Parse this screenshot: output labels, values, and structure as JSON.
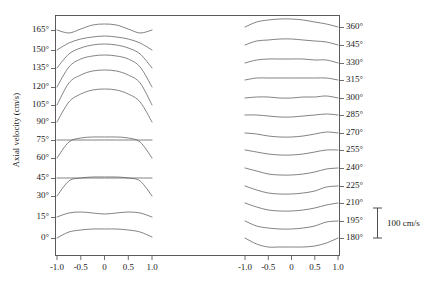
{
  "figure": {
    "y_axis_title": "Axial velocity (cm/s)",
    "scale_bar_label": "100 cm/s"
  },
  "chart_data": {
    "type": "line",
    "title": "",
    "subtitle": "",
    "xlabel": "",
    "ylabel": "Axial velocity (cm/s)",
    "grid": false,
    "legend": "none",
    "scale_bar": {
      "length_value": 100,
      "units": "cm/s",
      "label": "100 cm/s"
    },
    "panels": [
      {
        "name": "left-panel",
        "x": [
          -1.0,
          -0.75,
          -0.5,
          -0.25,
          0.0,
          0.25,
          0.5,
          0.75,
          1.0
        ],
        "xlim": [
          -1.15,
          1.15
        ],
        "xticks": [
          -1.0,
          -0.5,
          0,
          0.5,
          1.0
        ],
        "xticklabels": [
          "-1.0",
          "-0.5",
          "0",
          "0.5",
          "1.0"
        ],
        "offset_labels": [
          "0°",
          "15°",
          "30°",
          "45°",
          "60°",
          "75°",
          "90°",
          "105°",
          "120°",
          "135°",
          "150°",
          "165°"
        ],
        "series": [
          {
            "name": "0°",
            "baseline": 238,
            "values": [
              0,
              6,
              8,
              9,
              9,
              9,
              8,
              6,
              1
            ]
          },
          {
            "name": "15°",
            "baseline": 217,
            "values": [
              0,
              4,
              5,
              4,
              3,
              4,
              5,
              4,
              0
            ]
          },
          {
            "name": "30°",
            "baseline": 196,
            "values": [
              0,
              15,
              18,
              19,
              19,
              19,
              18,
              15,
              0
            ]
          },
          {
            "name": "45°",
            "baseline": 178,
            "values": [
              0,
              0,
              0,
              0,
              0,
              0,
              0,
              0,
              0
            ]
          },
          {
            "name": "60°",
            "baseline": 158,
            "values": [
              0,
              16,
              20,
              21,
              21,
              21,
              20,
              16,
              0
            ]
          },
          {
            "name": "75°",
            "baseline": 140,
            "values": [
              0,
              0,
              0,
              0,
              0,
              0,
              0,
              0,
              0
            ]
          },
          {
            "name": "90°",
            "baseline": 122,
            "values": [
              0,
              20,
              28,
              32,
              33,
              32,
              28,
              20,
              0
            ]
          },
          {
            "name": "105°",
            "baseline": 105,
            "values": [
              0,
              22,
              30,
              34,
              35,
              34,
              30,
              22,
              0
            ]
          },
          {
            "name": "120°",
            "baseline": 87,
            "values": [
              0,
              20,
              28,
              31,
              32,
              31,
              28,
              20,
              0
            ]
          },
          {
            "name": "135°",
            "baseline": 68,
            "values": [
              0,
              14,
              20,
              23,
              24,
              23,
              20,
              14,
              0
            ]
          },
          {
            "name": "150°",
            "baseline": 50,
            "values": [
              0,
              7,
              11,
              13,
              14,
              13,
              11,
              7,
              0
            ]
          },
          {
            "name": "165°",
            "baseline": 30,
            "values": [
              0,
              -3,
              1,
              5,
              6,
              5,
              1,
              -3,
              0
            ]
          }
        ]
      },
      {
        "name": "right-panel",
        "x": [
          -1.0,
          -0.75,
          -0.5,
          -0.25,
          0.0,
          0.25,
          0.5,
          0.75,
          1.0
        ],
        "xlim": [
          -1.15,
          1.15
        ],
        "xticks": [
          -1.0,
          -0.5,
          0,
          0.5,
          1.0
        ],
        "xticklabels": [
          "-1.0",
          "-0.5",
          "0",
          "0.5",
          "1.0"
        ],
        "offset_labels": [
          "180°",
          "195°",
          "210°",
          "225°",
          "240°",
          "255°",
          "270°",
          "285°",
          "300°",
          "315°",
          "330°",
          "345°",
          "360°"
        ],
        "series": [
          {
            "name": "180°",
            "baseline": 238,
            "values": [
              0,
              -6,
              -9,
              -9,
              -9,
              -9,
              -8,
              -5,
              0
            ]
          },
          {
            "name": "195°",
            "baseline": 221,
            "values": [
              0,
              -5,
              -7,
              -8,
              -8,
              -7,
              -5,
              -1,
              0
            ]
          },
          {
            "name": "210°",
            "baseline": 203,
            "values": [
              0,
              -4,
              -7,
              -8,
              -8,
              -7,
              -5,
              -2,
              0
            ]
          },
          {
            "name": "225°",
            "baseline": 186,
            "values": [
              0,
              -4,
              -7,
              -8,
              -8,
              -7,
              -5,
              -1,
              0
            ]
          },
          {
            "name": "240°",
            "baseline": 168,
            "values": [
              0,
              -3,
              -6,
              -7,
              -7,
              -6,
              -4,
              -1,
              0
            ]
          },
          {
            "name": "255°",
            "baseline": 150,
            "values": [
              0,
              -2,
              -4,
              -5,
              -5,
              -4,
              -2,
              0,
              0
            ]
          },
          {
            "name": "270°",
            "baseline": 133,
            "values": [
              0,
              -1,
              -3,
              -4,
              -4,
              -3,
              -1,
              1,
              0
            ]
          },
          {
            "name": "285°",
            "baseline": 115,
            "values": [
              0,
              0,
              -1,
              -2,
              -2,
              -1,
              0,
              1,
              0
            ]
          },
          {
            "name": "300°",
            "baseline": 98,
            "values": [
              0,
              1,
              1,
              0,
              0,
              1,
              1,
              2,
              0
            ]
          },
          {
            "name": "315°",
            "baseline": 80,
            "values": [
              0,
              2,
              2,
              2,
              2,
              2,
              2,
              2,
              0
            ]
          },
          {
            "name": "330°",
            "baseline": 63,
            "values": [
              0,
              3,
              4,
              4,
              4,
              4,
              3,
              3,
              0
            ]
          },
          {
            "name": "345°",
            "baseline": 45,
            "values": [
              0,
              4,
              5,
              6,
              6,
              5,
              4,
              3,
              0
            ]
          },
          {
            "name": "360°",
            "baseline": 27,
            "values": [
              0,
              5,
              7,
              8,
              8,
              7,
              5,
              3,
              0
            ]
          }
        ]
      }
    ]
  }
}
